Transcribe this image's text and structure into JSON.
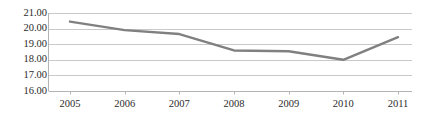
{
  "chart_data": {
    "type": "line",
    "title": "",
    "subtitle": "",
    "xlabel": "",
    "ylabel": "",
    "categories": [
      "2005",
      "2006",
      "2007",
      "2008",
      "2009",
      "2010",
      "2011"
    ],
    "x": [
      2005,
      2006,
      2007,
      2008,
      2009,
      2010,
      2011
    ],
    "series": [
      {
        "name": "",
        "values": [
          20.45,
          19.9,
          19.65,
          18.6,
          18.55,
          18.0,
          19.45
        ],
        "color": "#808080"
      }
    ],
    "ylim": [
      16.0,
      21.0
    ],
    "ytick_values": [
      21.0,
      20.0,
      19.0,
      18.0,
      17.0,
      16.0
    ],
    "ytick_labels": [
      "21.00",
      "20.00",
      "19.00",
      "18.00",
      "17.00",
      "16.00"
    ],
    "xtick_labels": [
      "2005",
      "2006",
      "2007",
      "2008",
      "2009",
      "2010",
      "2011"
    ],
    "grid": true,
    "grid_axis": "y",
    "legend": false,
    "legend_position": "none",
    "markers": false,
    "background_color": "#ffffff",
    "grid_color": "#c9c9c9",
    "axis_color": "#b4b4b4",
    "text_color": "#2b2b2b",
    "line_width": 2.4
  }
}
